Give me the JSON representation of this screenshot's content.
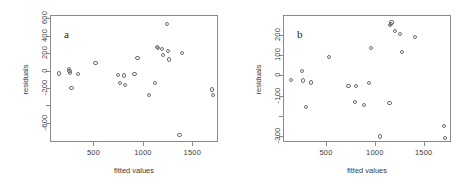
{
  "figure": {
    "title": "",
    "background": "#ffffff",
    "point_color": "#6e6e6e",
    "axis_color": "#8a8a8a",
    "text_color": "#3d3d3d"
  },
  "chart_data": [
    {
      "type": "scatter",
      "panel_label": "a",
      "title": "",
      "xlabel": "fitted values",
      "ylabel": "residuals",
      "xlim": [
        60,
        1760
      ],
      "ylim": [
        -820,
        640
      ],
      "xticks": [
        500,
        1000,
        1500
      ],
      "xticklabels": [
        "500",
        "1000",
        "1500"
      ],
      "yticks": [
        600,
        400,
        200,
        0,
        -200,
        -400,
        -600
      ],
      "yticklabels": [
        "600",
        "400",
        "200",
        "0",
        "-200",
        "",
        "-600"
      ],
      "grid": false,
      "legend": "none",
      "marker": "open-circle",
      "points": [
        {
          "x": 140,
          "y": -20
        },
        {
          "x": 243,
          "y": 30
        },
        {
          "x": 248,
          "y": 5
        },
        {
          "x": 255,
          "y": -15
        },
        {
          "x": 268,
          "y": -190
        },
        {
          "x": 330,
          "y": -25
        },
        {
          "x": 510,
          "y": 100
        },
        {
          "x": 735,
          "y": -40
        },
        {
          "x": 762,
          "y": -130
        },
        {
          "x": 800,
          "y": -45
        },
        {
          "x": 810,
          "y": -150
        },
        {
          "x": 905,
          "y": -25
        },
        {
          "x": 935,
          "y": 155
        },
        {
          "x": 1050,
          "y": -265
        },
        {
          "x": 1110,
          "y": -130
        },
        {
          "x": 1135,
          "y": 285
        },
        {
          "x": 1145,
          "y": 275
        },
        {
          "x": 1180,
          "y": 260
        },
        {
          "x": 1195,
          "y": 190
        },
        {
          "x": 1235,
          "y": 550
        },
        {
          "x": 1240,
          "y": 235
        },
        {
          "x": 1250,
          "y": 140
        },
        {
          "x": 1360,
          "y": -730
        },
        {
          "x": 1385,
          "y": 210
        },
        {
          "x": 1690,
          "y": -205
        },
        {
          "x": 1700,
          "y": -265
        }
      ]
    },
    {
      "type": "scatter",
      "panel_label": "b",
      "title": "",
      "xlabel": "fitted values",
      "ylabel": "residuals",
      "xlim": [
        60,
        1780
      ],
      "ylim": [
        -330,
        300
      ],
      "xticks": [
        500,
        1000,
        1500
      ],
      "xticklabels": [
        "500",
        "1000",
        "1500"
      ],
      "yticks": [
        200,
        100,
        0,
        -100,
        -200,
        -300
      ],
      "yticklabels": [
        "200",
        "100",
        "0",
        "-100",
        "",
        "-300"
      ],
      "grid": false,
      "legend": "none",
      "marker": "open-circle",
      "points": [
        {
          "x": 130,
          "y": -18
        },
        {
          "x": 245,
          "y": 28
        },
        {
          "x": 255,
          "y": -20
        },
        {
          "x": 285,
          "y": -150
        },
        {
          "x": 340,
          "y": -30
        },
        {
          "x": 520,
          "y": 95
        },
        {
          "x": 720,
          "y": -48
        },
        {
          "x": 790,
          "y": -125
        },
        {
          "x": 800,
          "y": -48
        },
        {
          "x": 875,
          "y": -140
        },
        {
          "x": 930,
          "y": -33
        },
        {
          "x": 950,
          "y": 140
        },
        {
          "x": 1040,
          "y": -298
        },
        {
          "x": 1140,
          "y": -130
        },
        {
          "x": 1148,
          "y": 255
        },
        {
          "x": 1155,
          "y": 262
        },
        {
          "x": 1160,
          "y": 268
        },
        {
          "x": 1200,
          "y": 225
        },
        {
          "x": 1250,
          "y": 212
        },
        {
          "x": 1270,
          "y": 120
        },
        {
          "x": 1400,
          "y": 195
        },
        {
          "x": 1700,
          "y": -245
        },
        {
          "x": 1710,
          "y": -305
        }
      ]
    }
  ]
}
